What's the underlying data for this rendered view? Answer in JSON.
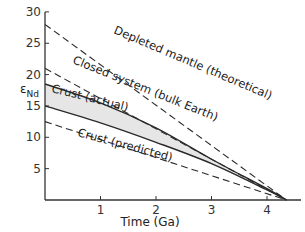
{
  "chart_data": {
    "type": "line",
    "title": "",
    "xlabel": "Time (Ga)",
    "ylabel": "εNd",
    "ylabel_main": "ε",
    "ylabel_sub": "Nd",
    "xlim": [
      0,
      4.5
    ],
    "ylim": [
      0,
      30
    ],
    "xticks": [
      1,
      2,
      3,
      4
    ],
    "yticks": [
      5,
      10,
      15,
      20,
      25,
      30
    ],
    "xtick_labels": [
      "1",
      "2",
      "3",
      "4"
    ],
    "ytick_labels": [
      "5",
      "10",
      "15",
      "20",
      "25",
      "30"
    ],
    "grid": false,
    "convergence_point": {
      "x": 4.35,
      "y": 0
    },
    "series": [
      {
        "name": "Depleted mantle (theoretical)",
        "style": "dashed",
        "x": [
          0,
          4.35
        ],
        "y": [
          28,
          0
        ]
      },
      {
        "name": "Closed system (bulk Earth)",
        "style": "dashed",
        "x": [
          0,
          4.35
        ],
        "y": [
          21,
          0
        ]
      },
      {
        "name": "Crust (actual) upper",
        "style": "solid",
        "x": [
          0,
          1,
          2,
          3,
          4,
          4.35
        ],
        "y": [
          18.5,
          15.5,
          11.5,
          6.5,
          1.8,
          0
        ]
      },
      {
        "name": "Crust (actual) lower",
        "style": "solid",
        "x": [
          0,
          1,
          2,
          3,
          4,
          4.35
        ],
        "y": [
          15,
          12.3,
          9.2,
          5.8,
          1.6,
          0
        ]
      },
      {
        "name": "Crust (predicted)",
        "style": "dashed",
        "x": [
          0,
          4.35
        ],
        "y": [
          12.5,
          0
        ]
      }
    ],
    "band": {
      "name": "Crust (actual)",
      "fill": "#e6e6e6"
    },
    "annotations": [
      {
        "text": "Depleted mantle (theoretical)"
      },
      {
        "text": "Closed system (bulk Earth)"
      },
      {
        "text": "Crust (actual)"
      },
      {
        "text": "Crust (predicted)"
      }
    ]
  },
  "colors": {
    "line": "#2a2a2a",
    "band": "#e6e6e6",
    "axis": "#333333"
  }
}
